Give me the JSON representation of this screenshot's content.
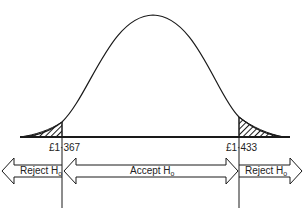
{
  "diagram": {
    "type": "normal-distribution-hypothesis-test",
    "critical_values": {
      "lower": "£1·367",
      "upper": "£1·433"
    },
    "regions": {
      "left": {
        "label": "Reject H",
        "subscript": "o"
      },
      "middle": {
        "label": "Accept H",
        "subscript": "o"
      },
      "right": {
        "label": "Reject H",
        "subscript": "o"
      }
    },
    "colors": {
      "stroke": "#1a1a1a",
      "background": "#ffffff"
    }
  }
}
